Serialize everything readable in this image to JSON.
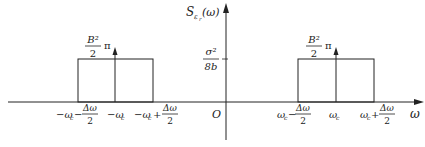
{
  "diagram": {
    "type": "power-spectral-density",
    "y_axis": {
      "label_main": "S",
      "label_sub": "ε",
      "label_subsub": "r",
      "label_arg": "(ω)"
    },
    "x_axis": {
      "label": "ω",
      "origin": "O"
    },
    "level_label": {
      "numerator": "σ²",
      "denominator": "8b"
    },
    "left_band": {
      "impulse_label": {
        "numerator": "B²",
        "denominator": "2",
        "factor": "π"
      },
      "ticks": {
        "low": {
          "prefix": "−ω",
          "sub": "c",
          "op": "−",
          "num": "Δω",
          "den": "2"
        },
        "center": {
          "prefix": "−ω",
          "sub": "c"
        },
        "high": {
          "prefix": "−ω",
          "sub": "c",
          "op": "+",
          "num": "Δω",
          "den": "2"
        }
      }
    },
    "right_band": {
      "impulse_label": {
        "numerator": "B²",
        "denominator": "2",
        "factor": "π"
      },
      "ticks": {
        "low": {
          "prefix": "ω",
          "sub": "c",
          "op": "−",
          "num": "Δω",
          "den": "2"
        },
        "center": {
          "prefix": "ω",
          "sub": "c"
        },
        "high": {
          "prefix": "ω",
          "sub": "c",
          "op": "+",
          "num": "Δω",
          "den": "2"
        }
      }
    },
    "colors": {
      "line": "#222222",
      "background": "#ffffff"
    }
  }
}
